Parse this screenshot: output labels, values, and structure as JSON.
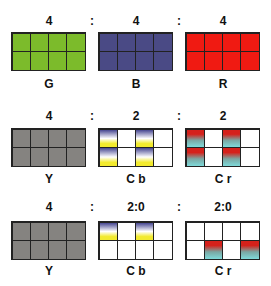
{
  "colors": {
    "G": "#7cbb2b",
    "B": "#4a4a85",
    "R": "#f01a12",
    "Y": "#858380",
    "cb_grad": [
      "#474791",
      "#ffffff",
      "#f2ea2e"
    ],
    "cr_grad": [
      "#d5211b",
      "#7aa6a2",
      "#7fdada"
    ],
    "empty": "#ffffff"
  },
  "rows": [
    {
      "ratio": [
        "4",
        "4",
        "4"
      ],
      "separator": ":",
      "grids": [
        {
          "label": "G",
          "cells": [
            "G",
            "G",
            "G",
            "G",
            "G",
            "G",
            "G",
            "G"
          ]
        },
        {
          "label": "B",
          "cells": [
            "B",
            "B",
            "B",
            "B",
            "B",
            "B",
            "B",
            "B"
          ]
        },
        {
          "label": "R",
          "cells": [
            "R",
            "R",
            "R",
            "R",
            "R",
            "R",
            "R",
            "R"
          ]
        }
      ]
    },
    {
      "ratio": [
        "4",
        "2",
        "2"
      ],
      "separator": ":",
      "grids": [
        {
          "label": "Y",
          "cells": [
            "Y",
            "Y",
            "Y",
            "Y",
            "Y",
            "Y",
            "Y",
            "Y"
          ]
        },
        {
          "label": "Cb",
          "cells": [
            "cb",
            "empty",
            "cb",
            "empty",
            "cb",
            "empty",
            "cb",
            "empty"
          ]
        },
        {
          "label": "Cr",
          "cells": [
            "cr",
            "empty",
            "cr",
            "empty",
            "cr",
            "empty",
            "cr",
            "empty"
          ]
        }
      ]
    },
    {
      "ratio": [
        "4",
        "2:0",
        "2:0"
      ],
      "separator": ":",
      "grids": [
        {
          "label": "Y",
          "cells": [
            "Y",
            "Y",
            "Y",
            "Y",
            "Y",
            "Y",
            "Y",
            "Y"
          ]
        },
        {
          "label": "Cb",
          "cells": [
            "cb",
            "empty",
            "cb",
            "empty",
            "empty",
            "empty",
            "empty",
            "empty"
          ]
        },
        {
          "label": "Cr",
          "cells": [
            "empty",
            "empty",
            "empty",
            "empty",
            "empty",
            "cr",
            "empty",
            "cr"
          ]
        }
      ]
    }
  ]
}
